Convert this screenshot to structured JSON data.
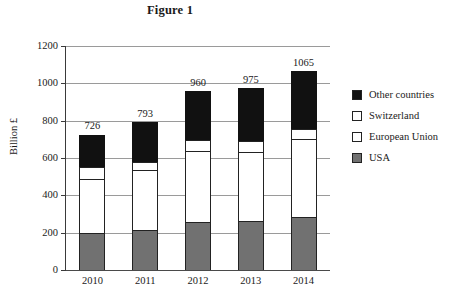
{
  "chart_data": {
    "type": "bar",
    "subtype": "stacked-bar",
    "title": "Figure 1",
    "xlabel": "",
    "ylabel": "Billion £",
    "ylim": [
      0,
      1200
    ],
    "yticks": [
      0,
      200,
      400,
      600,
      800,
      1000,
      1200
    ],
    "ytick_labels": [
      "0",
      "200",
      "400",
      "600",
      "800",
      "1000",
      "1200"
    ],
    "grid": true,
    "legend_position": "right",
    "categories": [
      "2010",
      "2011",
      "2012",
      "2013",
      "2014"
    ],
    "series": [
      {
        "name": "USA",
        "color": "#717171",
        "values": [
          200,
          215,
          255,
          260,
          285
        ]
      },
      {
        "name": "European Union",
        "color": "#ffffff",
        "values": [
          290,
          320,
          380,
          370,
          415
        ]
      },
      {
        "name": "Switzerland",
        "color": "#ffffff",
        "values": [
          60,
          45,
          60,
          60,
          55
        ]
      },
      {
        "name": "Other countries",
        "color": "#111111",
        "values": [
          176,
          213,
          265,
          285,
          310
        ]
      }
    ],
    "stack_order_bottom_to_top": [
      "USA",
      "European Union",
      "Switzerland",
      "Other countries"
    ],
    "legend_order_top_to_bottom": [
      "Other countries",
      "Switzerland",
      "European Union",
      "USA"
    ],
    "totals": [
      726,
      793,
      960,
      975,
      1065
    ],
    "total_labels": [
      "726",
      "793",
      "960",
      "975",
      "1065"
    ]
  },
  "legend": {
    "items": [
      {
        "label": "Other countries",
        "color": "#111111"
      },
      {
        "label": "Switzerland",
        "color": "#ffffff"
      },
      {
        "label": "European Union",
        "color": "#ffffff"
      },
      {
        "label": "USA",
        "color": "#717171"
      }
    ]
  }
}
